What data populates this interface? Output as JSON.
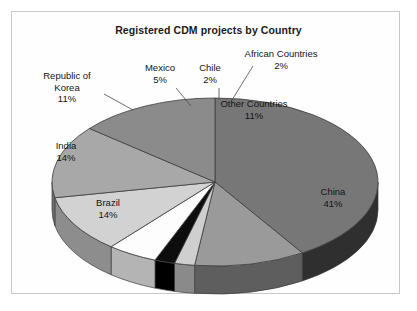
{
  "chart_data": {
    "type": "pie",
    "title": "Registered CDM projects by Country",
    "xlabel": "",
    "ylabel": "",
    "unit": "%",
    "legend": "none",
    "grid": false,
    "three_d": true,
    "categories": [
      "China",
      "Other Countries",
      "African Countries",
      "Chile",
      "Mexico",
      "Republic of Korea",
      "India",
      "Brazil"
    ],
    "values": [
      41,
      11,
      2,
      2,
      5,
      11,
      14,
      14
    ],
    "slices": [
      {
        "label": "China",
        "pct_text": "41%",
        "value": 41,
        "color": "#777777",
        "side_color": "#2f2f2f"
      },
      {
        "label": "Other Countries",
        "pct_text": "11%",
        "value": 11,
        "color": "#9a9a9a",
        "side_color": "#5e5e5e"
      },
      {
        "label": "African Countries",
        "pct_text": "2%",
        "value": 2,
        "color": "#cfcfcf",
        "side_color": "#8a8a8a"
      },
      {
        "label": "Chile",
        "pct_text": "2%",
        "value": 2,
        "color": "#0d0d0d",
        "side_color": "#000000"
      },
      {
        "label": "Mexico",
        "pct_text": "5%",
        "value": 5,
        "color": "#fdfdfd",
        "side_color": "#b4b4b4"
      },
      {
        "label": "Republic of Korea",
        "pct_text": "11%",
        "value": 11,
        "color": "#d2d2d2",
        "side_color": "#8d8d8d"
      },
      {
        "label": "India",
        "pct_text": "14%",
        "value": 14,
        "color": "#a8a8a8",
        "side_color": "#6d6d6d"
      },
      {
        "label": "Brazil",
        "pct_text": "14%",
        "value": 14,
        "color": "#8b8b8b",
        "side_color": "#565656"
      }
    ]
  },
  "labels": {
    "korea": {
      "name": "Republic of",
      "name2": "Korea",
      "pct": "11%"
    },
    "mexico": {
      "name": "Mexico",
      "pct": "5%"
    },
    "chile": {
      "name": "Chile",
      "pct": "2%"
    },
    "african": {
      "name": "African Countries",
      "pct": "2%"
    },
    "other": {
      "name": "Other Countries",
      "pct": "11%"
    },
    "china": {
      "name": "China",
      "pct": "41%"
    },
    "india": {
      "name": "India",
      "pct": "14%"
    },
    "brazil": {
      "name": "Brazil",
      "pct": "14%"
    }
  },
  "colors": {
    "frame_border": "#c8c8c8",
    "background": "#ffffff",
    "text": "#141414",
    "slice_outline": "#3c3c3c"
  }
}
